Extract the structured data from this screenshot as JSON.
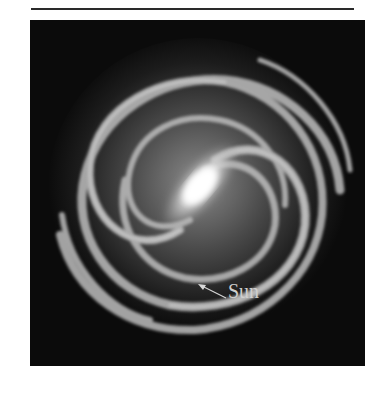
{
  "figure": {
    "annotation": {
      "label": "Sun",
      "has_arrow": true
    }
  },
  "colors": {
    "background": "#0b0b0b",
    "arm": "#bdbdbd",
    "core": "#ffffff",
    "label": "#cfcfcf"
  }
}
